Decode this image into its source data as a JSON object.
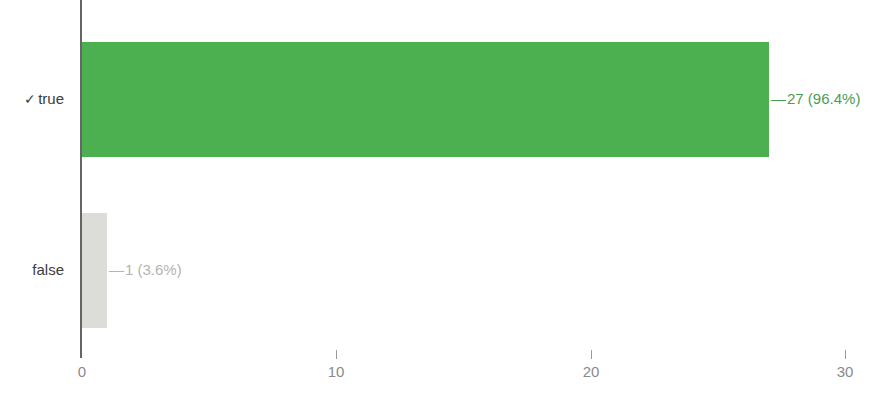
{
  "chart_data": {
    "type": "bar",
    "orientation": "horizontal",
    "title": "",
    "xlabel": "",
    "ylabel": "",
    "categories": [
      "✓ true",
      "false"
    ],
    "values": [
      27,
      1
    ],
    "percentages": [
      "96.4%",
      "3.6%"
    ],
    "data_labels": [
      "27 (96.4%)",
      "1 (3.6%)"
    ],
    "series": [
      {
        "name": "count",
        "values": [
          27,
          1
        ]
      }
    ],
    "bars": [
      {
        "category": "✓ true",
        "category_check": "✓",
        "category_text": "true",
        "value": 27,
        "percent": "96.4%",
        "label": "27 (96.4%)",
        "color": "#4caf50",
        "label_color": "#4a9e52"
      },
      {
        "category": "false",
        "category_check": "",
        "category_text": "false",
        "value": 1,
        "percent": "3.6%",
        "label": "1 (3.6%)",
        "color": "#dcdcd8",
        "label_color": "#b4b4b0"
      }
    ],
    "xlim": [
      0,
      30
    ],
    "xticks": [
      0,
      10,
      20,
      30
    ],
    "xtick_labels": [
      "0",
      "10",
      "20",
      "30"
    ],
    "grid": false,
    "legend": null,
    "connector": "—",
    "axis_color": "#666666",
    "tick_label_color": "#8a8a8a",
    "category_label_color": "#3c3c3c",
    "background": "#ffffff"
  }
}
